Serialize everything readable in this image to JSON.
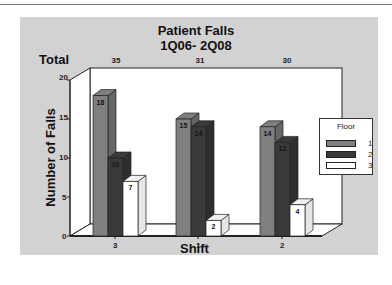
{
  "chart_data": {
    "type": "bar",
    "title": "Patient Falls",
    "subtitle": "1Q06- 2Q08",
    "xlabel": "Shift",
    "ylabel": "Number of Falls",
    "ylim": [
      0,
      20
    ],
    "yticks": [
      "0",
      "5",
      "10",
      "15",
      "20"
    ],
    "categories": [
      "3",
      "1",
      "2"
    ],
    "totals_label": "Total",
    "totals": [
      "35",
      "31",
      "30"
    ],
    "legend_title": "Floor",
    "legend_position": "right",
    "series": [
      {
        "name": "1",
        "values": [
          18,
          15,
          14
        ],
        "color": "#7f7f7f"
      },
      {
        "name": "2",
        "values": [
          10,
          14,
          12
        ],
        "color": "#3a3a3a"
      },
      {
        "name": "3",
        "values": [
          7,
          2,
          4
        ],
        "color": "#ffffff"
      }
    ],
    "grid": false,
    "style": "3d"
  }
}
